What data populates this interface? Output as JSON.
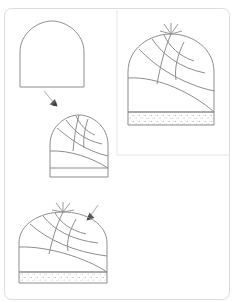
{
  "page": {
    "background_color": "#ffffff",
    "border_color": "#dcdcdc",
    "ink_color": "#8d8d8d",
    "border": {
      "x": 4,
      "y": 8,
      "width": 226,
      "height": 292,
      "radius": 7
    },
    "dividers": [
      {
        "name": "vertical-divider",
        "x1": 117,
        "y1": 10,
        "x2": 117,
        "y2": 155
      },
      {
        "name": "horizontal-divider",
        "x1": 117,
        "y1": 155,
        "x2": 230,
        "y2": 155
      }
    ]
  },
  "figures": [
    {
      "id": "step-1",
      "name": "plain-dome-outline",
      "label": "Plain pointed dome outline, no seams",
      "cell": "top-left",
      "cx": 52,
      "base_y": 87,
      "half_w": 32,
      "height": 66,
      "has_tuft": false,
      "has_brim": false,
      "panels": []
    },
    {
      "id": "step-2",
      "name": "dome-with-spiral-panels",
      "label": "Dome divided into spiral panels, plain band at base",
      "cell": "middle-left",
      "cx": 79,
      "base_y": 177,
      "half_w": 29,
      "height": 62,
      "has_tuft": false,
      "has_brim": true,
      "brim_style": "plain",
      "brim_height": 9,
      "panels": [
        "spiral-seam-1",
        "spiral-seam-2",
        "spiral-seam-3",
        "spiral-seam-4",
        "spiral-seam-5",
        "spiral-seam-6"
      ]
    },
    {
      "id": "step-3",
      "name": "finished-hat-speckled-brim",
      "label": "Finished hat with tuft at apex and speckled brim",
      "cell": "top-right",
      "cx": 171,
      "base_y": 112,
      "half_w": 43,
      "height": 78,
      "has_tuft": true,
      "has_brim": true,
      "brim_style": "speckled",
      "brim_height": 13,
      "panels": [
        "spiral-seam-1",
        "spiral-seam-2",
        "spiral-seam-3",
        "spiral-seam-4",
        "spiral-seam-5",
        "spiral-seam-6"
      ]
    },
    {
      "id": "step-4",
      "name": "finished-hat-speckled-brim-lower",
      "label": "Finished hat with tuft at apex and speckled brim",
      "cell": "bottom-left",
      "cx": 63,
      "base_y": 272,
      "half_w": 44,
      "height": 60,
      "has_tuft": true,
      "has_brim": true,
      "brim_style": "speckled",
      "brim_height": 11,
      "panels": [
        "spiral-seam-1",
        "spiral-seam-2",
        "spiral-seam-3",
        "spiral-seam-4",
        "spiral-seam-5",
        "spiral-seam-6"
      ]
    }
  ],
  "cursors": [
    {
      "id": "cursor-1",
      "name": "cursor-arrow-down-right",
      "x": 44,
      "y": 91,
      "rotation": 28,
      "label": "Arrow pointing from step 1 to step 2"
    },
    {
      "id": "cursor-2",
      "name": "cursor-arrow-down-left",
      "x": 88,
      "y": 205,
      "rotation": -32,
      "label": "Arrow pointing from step 3 to step 4"
    }
  ]
}
